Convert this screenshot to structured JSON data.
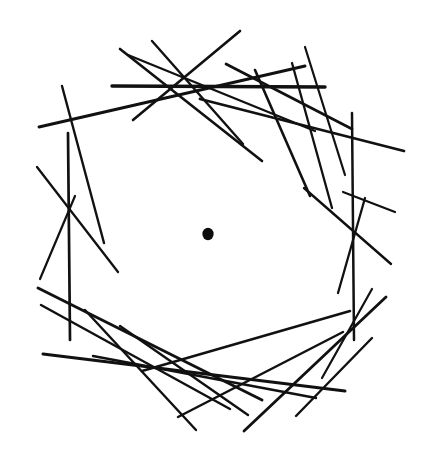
{
  "figure": {
    "type": "geometric-line-envelope",
    "canvas": {
      "width": 423,
      "height": 467,
      "background": "#ffffff"
    },
    "ink_color": "#111111",
    "dot_color": "#0d0d0d",
    "envelope_circle": {
      "cx": 208,
      "cy": 234,
      "r": 142,
      "visible": false
    },
    "center_dot": {
      "cx": 208,
      "cy": 234,
      "rx": 5.6,
      "ry": 6.2
    },
    "line_count": 26,
    "lines": [
      {
        "id": "line-01",
        "x1": 112,
        "y1": 86,
        "x2": 325,
        "y2": 87,
        "w": 3.4,
        "note": "top horizontal tangent"
      },
      {
        "id": "line-02",
        "x1": 120,
        "y1": 49,
        "x2": 262,
        "y2": 161,
        "w": 2.6,
        "note": "upper-left steep descending"
      },
      {
        "id": "line-03",
        "x1": 152,
        "y1": 41,
        "x2": 243,
        "y2": 144,
        "w": 2.4,
        "note": "upper-left steep descending 2"
      },
      {
        "id": "line-04",
        "x1": 240,
        "y1": 31,
        "x2": 133,
        "y2": 120,
        "w": 2.6,
        "note": "upper ridge running left-down"
      },
      {
        "id": "line-05",
        "x1": 128,
        "y1": 55,
        "x2": 315,
        "y2": 131,
        "w": 2.3,
        "note": "shallow descending to right"
      },
      {
        "id": "line-06",
        "x1": 39,
        "y1": 127,
        "x2": 305,
        "y2": 66,
        "w": 2.9,
        "note": "long shallow rising to upper right"
      },
      {
        "id": "line-07",
        "x1": 226,
        "y1": 64,
        "x2": 352,
        "y2": 129,
        "w": 2.7,
        "note": "upper-right descending"
      },
      {
        "id": "line-08",
        "x1": 255,
        "y1": 70,
        "x2": 310,
        "y2": 196,
        "w": 2.6,
        "note": "right steep descending"
      },
      {
        "id": "line-09",
        "x1": 292,
        "y1": 63,
        "x2": 332,
        "y2": 208,
        "w": 2.3,
        "note": "right steep descending 2"
      },
      {
        "id": "line-10",
        "x1": 305,
        "y1": 47,
        "x2": 345,
        "y2": 175,
        "w": 2.2,
        "note": "right steep descending 3"
      },
      {
        "id": "line-11",
        "x1": 200,
        "y1": 99,
        "x2": 404,
        "y2": 151,
        "w": 2.8,
        "note": "long shallow to far right"
      },
      {
        "id": "line-12",
        "x1": 352,
        "y1": 113,
        "x2": 354,
        "y2": 340,
        "w": 2.5,
        "note": "right near-vertical tangent"
      },
      {
        "id": "line-13",
        "x1": 68,
        "y1": 133,
        "x2": 70,
        "y2": 340,
        "w": 2.7,
        "note": "left near-vertical tangent"
      },
      {
        "id": "line-14",
        "x1": 62,
        "y1": 86,
        "x2": 104,
        "y2": 243,
        "w": 2.4,
        "note": "left steep descending"
      },
      {
        "id": "line-15",
        "x1": 37,
        "y1": 167,
        "x2": 118,
        "y2": 272,
        "w": 2.3,
        "note": "left descending to lower right"
      },
      {
        "id": "line-16",
        "x1": 75,
        "y1": 196,
        "x2": 40,
        "y2": 279,
        "w": 2.2,
        "note": "left short descending-left"
      },
      {
        "id": "line-17",
        "x1": 304,
        "y1": 188,
        "x2": 391,
        "y2": 264,
        "w": 2.4,
        "note": "right descending outward"
      },
      {
        "id": "line-18",
        "x1": 343,
        "y1": 192,
        "x2": 395,
        "y2": 212,
        "w": 2.2,
        "note": "right short shallow"
      },
      {
        "id": "line-19",
        "x1": 365,
        "y1": 198,
        "x2": 338,
        "y2": 293,
        "w": 2.3,
        "note": "right descending-left"
      },
      {
        "id": "line-20",
        "x1": 38,
        "y1": 288,
        "x2": 262,
        "y2": 400,
        "w": 2.9,
        "note": "long lower-left rising right"
      },
      {
        "id": "line-21",
        "x1": 41,
        "y1": 305,
        "x2": 230,
        "y2": 409,
        "w": 2.5,
        "note": "lower-left rising right 2"
      },
      {
        "id": "line-22",
        "x1": 43,
        "y1": 354,
        "x2": 345,
        "y2": 391,
        "w": 3.0,
        "note": "long bottom shallow"
      },
      {
        "id": "line-23",
        "x1": 85,
        "y1": 310,
        "x2": 196,
        "y2": 430,
        "w": 2.4,
        "note": "lower-left steep descending"
      },
      {
        "id": "line-24",
        "x1": 120,
        "y1": 326,
        "x2": 248,
        "y2": 415,
        "w": 2.4,
        "note": "lower-left descending 2"
      },
      {
        "id": "line-25",
        "x1": 244,
        "y1": 431,
        "x2": 386,
        "y2": 297,
        "w": 2.8,
        "note": "lower-right rising"
      },
      {
        "id": "line-26",
        "x1": 178,
        "y1": 417,
        "x2": 343,
        "y2": 332,
        "w": 2.5,
        "note": "bottom rising to right"
      },
      {
        "id": "line-27",
        "x1": 296,
        "y1": 416,
        "x2": 372,
        "y2": 338,
        "w": 2.4,
        "note": "lower-right short rising"
      },
      {
        "id": "line-28",
        "x1": 322,
        "y1": 378,
        "x2": 372,
        "y2": 289,
        "w": 2.2,
        "note": "lower-right short rising 2"
      },
      {
        "id": "line-29",
        "x1": 93,
        "y1": 356,
        "x2": 316,
        "y2": 398,
        "w": 2.4,
        "note": "bottom shallow 2"
      },
      {
        "id": "line-30",
        "x1": 142,
        "y1": 371,
        "x2": 350,
        "y2": 311,
        "w": 2.5,
        "note": "bottom-right rising shallow"
      }
    ]
  }
}
